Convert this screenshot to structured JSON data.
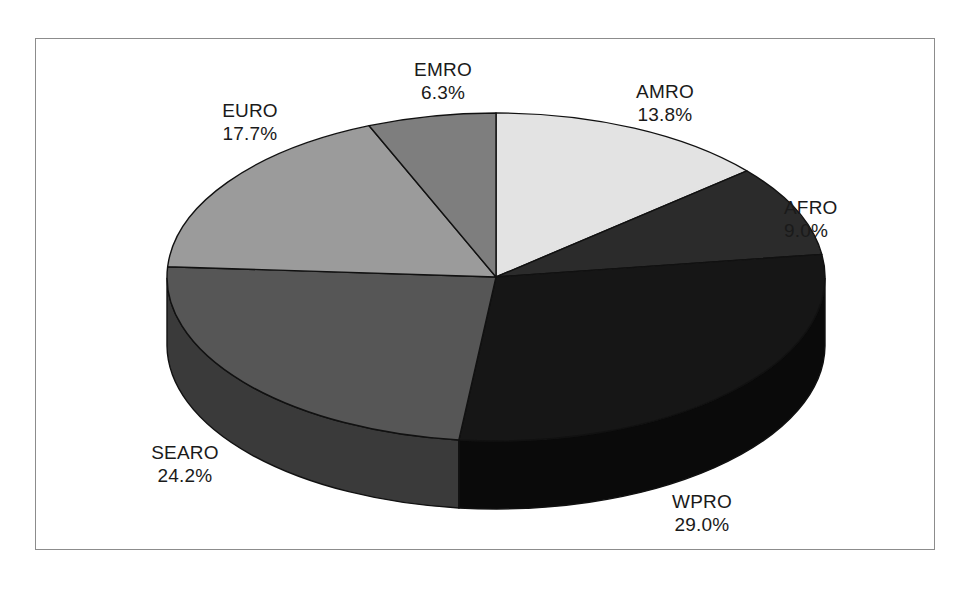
{
  "chart_data": {
    "type": "pie",
    "title": "",
    "subtitle": "",
    "xlabel": "",
    "ylabel": "",
    "legend_position": "none",
    "grid": false,
    "three_d": true,
    "start_angle_deg": -90,
    "direction": "clockwise",
    "categories": [
      "AMRO",
      "AFRO",
      "WPRO",
      "SEARO",
      "EURO",
      "EMRO"
    ],
    "values": [
      13.8,
      9.0,
      29.0,
      24.2,
      17.7,
      6.3
    ],
    "unit": "%",
    "slices": [
      {
        "label": "AMRO",
        "value": 13.8,
        "value_text": "13.8%",
        "color": "#e3e3e3",
        "side_color": "#c3c3c3",
        "start_deg": -90,
        "sweep_deg": 49.68
      },
      {
        "label": "AFRO",
        "value": 9.0,
        "value_text": "9.0%",
        "color": "#2b2b2b",
        "side_color": "#1e1e1e",
        "start_deg": -40.32,
        "sweep_deg": 32.4
      },
      {
        "label": "WPRO",
        "value": 29.0,
        "value_text": "29.0%",
        "color": "#161616",
        "side_color": "#0a0a0a",
        "start_deg": -7.92,
        "sweep_deg": 104.4
      },
      {
        "label": "SEARO",
        "value": 24.2,
        "value_text": "24.2%",
        "color": "#565656",
        "side_color": "#3a3a3a",
        "start_deg": 96.48,
        "sweep_deg": 87.12
      },
      {
        "label": "EURO",
        "value": 17.7,
        "value_text": "17.7%",
        "color": "#9b9b9b",
        "side_color": "#777777",
        "start_deg": 183.6,
        "sweep_deg": 63.72
      },
      {
        "label": "EMRO",
        "value": 6.3,
        "value_text": "6.3%",
        "color": "#7e7e7e",
        "side_color": "#5e5e5e",
        "start_deg": 247.32,
        "sweep_deg": 22.68
      }
    ],
    "geometry": {
      "center_x": 496,
      "center_y": 277,
      "radius_x": 329,
      "radius_y": 164,
      "depth": 68
    },
    "style": {
      "outline_color": "#111111",
      "frame_color": "#8c8c8c",
      "background": "#ffffff",
      "label_color": "#1a1a1a"
    }
  },
  "labels": {
    "emro": {
      "name": "EMRO",
      "value": "6.3%"
    },
    "amro": {
      "name": "AMRO",
      "value": "13.8%"
    },
    "afro": {
      "name": "AFRO",
      "value": "9.0%"
    },
    "euro": {
      "name": "EURO",
      "value": "17.7%"
    },
    "searo": {
      "name": "SEARO",
      "value": "24.2%"
    },
    "wpro": {
      "name": "WPRO",
      "value": "29.0%"
    }
  }
}
